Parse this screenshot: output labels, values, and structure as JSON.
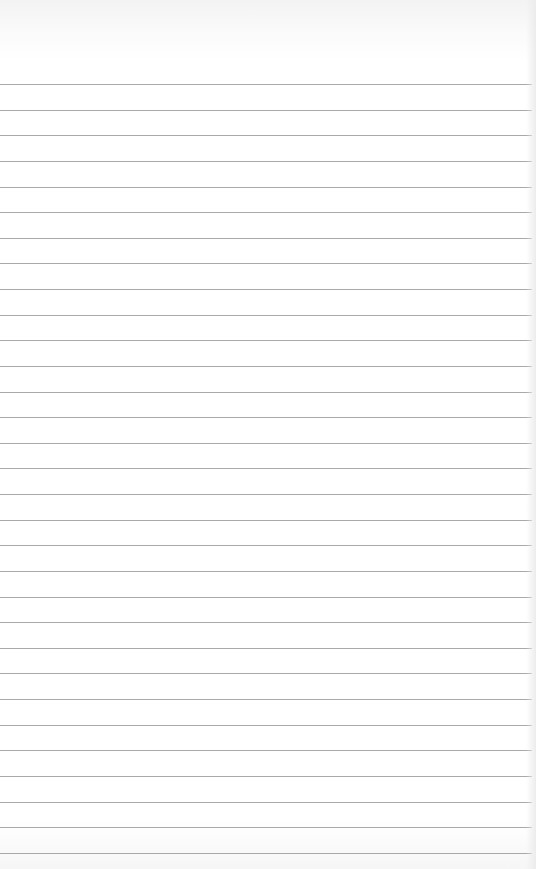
{
  "page": {
    "type": "lined-paper",
    "background_color": "#ffffff",
    "line_color": "#9a9a9a",
    "line_count": 31,
    "first_line_y": 84,
    "line_spacing": 25.63
  }
}
